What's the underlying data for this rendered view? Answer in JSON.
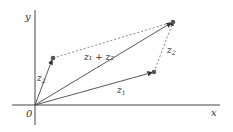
{
  "diagram": {
    "axes": {
      "x_label": "x",
      "y_label": "y",
      "origin_label": "0"
    },
    "vectors": [
      {
        "name": "z1",
        "label_base": "z",
        "label_sub": "1"
      },
      {
        "name": "z2",
        "label_base": "z",
        "label_sub": "2"
      },
      {
        "name": "z1+z2",
        "label": "z₁ + z₂"
      }
    ],
    "edge_labels": {
      "z2_translated": {
        "label_base": "z",
        "label_sub": "2"
      }
    },
    "colors": {
      "line": "#444444",
      "point": "#555555",
      "dashed": "#666666"
    }
  }
}
